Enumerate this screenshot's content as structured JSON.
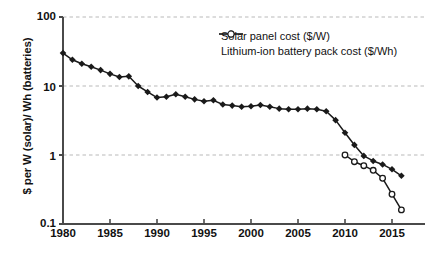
{
  "chart_data": {
    "type": "line",
    "title": "",
    "subtitle": "",
    "xlabel": "",
    "ylabel": "$ per W (solar)/ Wh (batteries)",
    "yscale": "log",
    "ylim": [
      0.1,
      100
    ],
    "xlim": [
      1979,
      2016.5
    ],
    "ytick_labels": [
      "100",
      "10",
      "1",
      "0.1"
    ],
    "ytick_values": [
      100,
      10,
      1,
      0.1
    ],
    "xtick_labels": [
      "1980",
      "1985",
      "1990",
      "1995",
      "2000",
      "2005",
      "2010",
      "2015"
    ],
    "xtick_values": [
      1980,
      1985,
      1990,
      1995,
      2000,
      2005,
      2010,
      2015
    ],
    "grid": "horizontal-dashed",
    "legend_position": "top-right",
    "series": [
      {
        "name": "Solar panel cost ($/W)",
        "marker": "filled-diamond",
        "color": "#1a1a1a",
        "x": [
          1980,
          1981,
          1982,
          1983,
          1984,
          1985,
          1986,
          1987,
          1988,
          1989,
          1990,
          1991,
          1992,
          1993,
          1994,
          1995,
          1996,
          1997,
          1998,
          1999,
          2000,
          2001,
          2002,
          2003,
          2004,
          2005,
          2006,
          2007,
          2008,
          2009,
          2010,
          2011,
          2012,
          2013,
          2014,
          2015,
          2016
        ],
        "values": [
          30.0,
          24.0,
          21.0,
          19.0,
          17.0,
          15.0,
          13.5,
          13.8,
          10.0,
          8.2,
          6.8,
          7.0,
          7.6,
          7.0,
          6.4,
          6.0,
          6.2,
          5.4,
          5.2,
          5.0,
          5.1,
          5.3,
          5.0,
          4.7,
          4.6,
          4.6,
          4.7,
          4.6,
          4.3,
          3.2,
          2.1,
          1.4,
          0.97,
          0.82,
          0.73,
          0.62,
          0.5
        ]
      },
      {
        "name": "Lithium-ion battery pack cost ($/Wh)",
        "marker": "open-circle",
        "color": "#1a1a1a",
        "x": [
          2010,
          2011,
          2012,
          2013,
          2014,
          2015,
          2016
        ],
        "values": [
          1.0,
          0.8,
          0.7,
          0.6,
          0.46,
          0.27,
          0.16
        ]
      }
    ]
  },
  "legend": {
    "items": [
      {
        "label": "Solar panel cost ($/W)",
        "marker": "filled-diamond"
      },
      {
        "label": "Lithium-ion battery pack cost ($/Wh)",
        "marker": "open-circle"
      }
    ]
  }
}
